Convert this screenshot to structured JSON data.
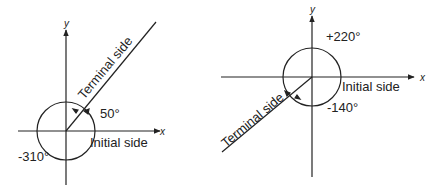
{
  "diagrams": [
    {
      "name": "positive-and-negative-coterminal-angles-50",
      "axis_x_label": "x",
      "axis_y_label": "y",
      "terminal_label": "Terminal side",
      "initial_label": "Initial side",
      "positive_angle_label": "50°",
      "negative_angle_label": "-310°"
    },
    {
      "name": "positive-and-negative-coterminal-angles-220",
      "axis_x_label": "x",
      "axis_y_label": "y",
      "terminal_label": "Terminal side",
      "initial_label": "Initial side",
      "positive_angle_label": "+220°",
      "negative_angle_label": "-140°"
    }
  ],
  "colors": {
    "ink": "#222222",
    "background": "#ffffff"
  }
}
